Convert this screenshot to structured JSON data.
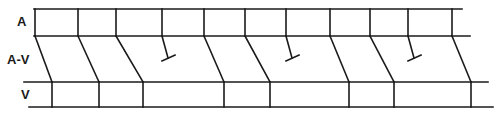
{
  "diagram": {
    "type": "ladder-diagram",
    "tiers": [
      {
        "id": "A",
        "label": "A",
        "label_x": 17,
        "label_y": 26
      },
      {
        "id": "AV",
        "label": "A-V",
        "label_x": 7,
        "label_y": 64
      },
      {
        "id": "V",
        "label": "V",
        "label_x": 21,
        "label_y": 99
      }
    ],
    "horizontal_lines": [
      {
        "x1": 34,
        "x2": 462,
        "y": 9
      },
      {
        "x1": 34,
        "x2": 470,
        "y": 36
      },
      {
        "x1": 24,
        "x2": 488,
        "y": 82
      },
      {
        "x1": 29,
        "x2": 493,
        "y": 107
      }
    ],
    "atrial_beats_x": [
      35,
      78,
      116,
      162,
      204,
      245,
      286,
      330,
      370,
      408,
      452
    ],
    "conducted": [
      {
        "ax": 35,
        "vx": 52
      },
      {
        "ax": 78,
        "vx": 99
      },
      {
        "ax": 116,
        "vx": 143
      },
      {
        "ax": 204,
        "vx": 224
      },
      {
        "ax": 245,
        "vx": 270
      },
      {
        "ax": 330,
        "vx": 349
      },
      {
        "ax": 370,
        "vx": 394
      },
      {
        "ax": 452,
        "vx": 471
      }
    ],
    "blocked": [
      {
        "ax": 162,
        "end_x": 168,
        "end_y": 58
      },
      {
        "ax": 286,
        "end_x": 292,
        "end_y": 58
      },
      {
        "ax": 408,
        "end_x": 414,
        "end_y": 58
      }
    ],
    "colors": {
      "line": "#1a1a1a",
      "background": "#ffffff"
    }
  }
}
